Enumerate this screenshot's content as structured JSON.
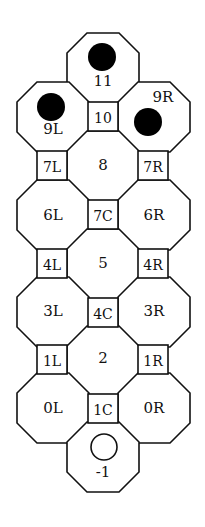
{
  "diagram": {
    "title": "",
    "colors": {
      "line": "#111111",
      "fill": "#ffffff",
      "token": "#000000"
    },
    "octagon": {
      "width": 72,
      "height": 70,
      "cut": 20
    },
    "square": {
      "width": 30,
      "height": 29
    },
    "octagons": [
      {
        "id": "11",
        "label": "11",
        "x": 67,
        "y": 33,
        "lx": 103,
        "ly": 81
      },
      {
        "id": "9L",
        "label": "9L",
        "x": 17,
        "y": 82,
        "lx": 53,
        "ly": 129
      },
      {
        "id": "9R",
        "label": "9R",
        "x": 118,
        "y": 82,
        "lx": 163,
        "ly": 97
      },
      {
        "id": "8",
        "label": "8",
        "x": 67,
        "y": 131,
        "lx": 103,
        "ly": 165
      },
      {
        "id": "6L",
        "label": "6L",
        "x": 17,
        "y": 180,
        "lx": 53,
        "ly": 215
      },
      {
        "id": "6R",
        "label": "6R",
        "x": 118,
        "y": 180,
        "lx": 154,
        "ly": 215
      },
      {
        "id": "5",
        "label": "5",
        "x": 67,
        "y": 229,
        "lx": 103,
        "ly": 263
      },
      {
        "id": "3L",
        "label": "3L",
        "x": 17,
        "y": 277,
        "lx": 53,
        "ly": 311
      },
      {
        "id": "3R",
        "label": "3R",
        "x": 118,
        "y": 277,
        "lx": 154,
        "ly": 311
      },
      {
        "id": "2",
        "label": "2",
        "x": 67,
        "y": 326,
        "lx": 103,
        "ly": 358
      },
      {
        "id": "0L",
        "label": "0L",
        "x": 17,
        "y": 373,
        "lx": 53,
        "ly": 408
      },
      {
        "id": "0R",
        "label": "0R",
        "x": 118,
        "y": 373,
        "lx": 154,
        "ly": 408
      },
      {
        "id": "-1",
        "label": "-1",
        "x": 67,
        "y": 422,
        "lx": 103,
        "ly": 472
      }
    ],
    "squares": [
      {
        "id": "10",
        "label": "10",
        "x": 88,
        "y": 102
      },
      {
        "id": "7L",
        "label": "7L",
        "x": 37,
        "y": 151
      },
      {
        "id": "7R",
        "label": "7R",
        "x": 138,
        "y": 151
      },
      {
        "id": "7C",
        "label": "7C",
        "x": 88,
        "y": 200
      },
      {
        "id": "4L",
        "label": "4L",
        "x": 37,
        "y": 249
      },
      {
        "id": "4R",
        "label": "4R",
        "x": 138,
        "y": 249
      },
      {
        "id": "4C",
        "label": "4C",
        "x": 88,
        "y": 298
      },
      {
        "id": "1L",
        "label": "1L",
        "x": 37,
        "y": 345
      },
      {
        "id": "1R",
        "label": "1R",
        "x": 138,
        "y": 345
      },
      {
        "id": "1C",
        "label": "1C",
        "x": 88,
        "y": 394
      }
    ],
    "tokens": [
      {
        "space": "11",
        "type": "filled",
        "cx": 102,
        "cy": 57,
        "r": 14
      },
      {
        "space": "9L",
        "type": "filled",
        "cx": 51,
        "cy": 107,
        "r": 14
      },
      {
        "space": "9R",
        "type": "filled",
        "cx": 148,
        "cy": 122,
        "r": 14
      },
      {
        "space": "-1",
        "type": "empty",
        "cx": 104,
        "cy": 447,
        "r": 13
      }
    ]
  }
}
